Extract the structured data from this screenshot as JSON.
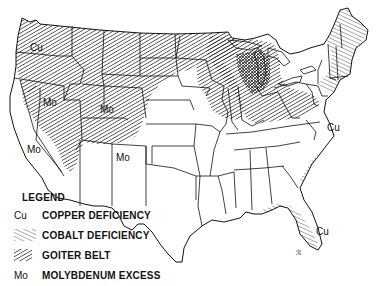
{
  "map": {
    "title": "Trace element deficiencies and excesses in the United States",
    "region": "Contiguous United States"
  },
  "labels": [
    {
      "id": "cu-washington",
      "text": "Cu",
      "x": 30,
      "y": 51
    },
    {
      "id": "mo-nevada",
      "text": "Mo",
      "x": 43,
      "y": 106
    },
    {
      "id": "mo-utah",
      "text": "Mo",
      "x": 100,
      "y": 113
    },
    {
      "id": "mo-california",
      "text": "Mo",
      "x": 27,
      "y": 153
    },
    {
      "id": "mo-new-mexico",
      "text": "Mo",
      "x": 116,
      "y": 161
    },
    {
      "id": "cu-virginia",
      "text": "Cu",
      "x": 327,
      "y": 131
    },
    {
      "id": "cu-florida",
      "text": "Cu",
      "x": 316,
      "y": 235
    }
  ],
  "legend": {
    "title": "LEGEND",
    "items": [
      {
        "symbol": "Cu",
        "symbol_type": "text",
        "label": "COPPER DEFICIENCY"
      },
      {
        "symbol": "cobalt-hatch",
        "symbol_type": "pattern",
        "label": "COBALT DEFICIENCY"
      },
      {
        "symbol": "goiter-hatch",
        "symbol_type": "pattern",
        "label": "GOITER BELT"
      },
      {
        "symbol": "Mo",
        "symbol_type": "text",
        "label": "MOLYBDENUM EXCESS"
      }
    ]
  },
  "colors": {
    "ink": "#111111",
    "background": "#ffffff"
  }
}
